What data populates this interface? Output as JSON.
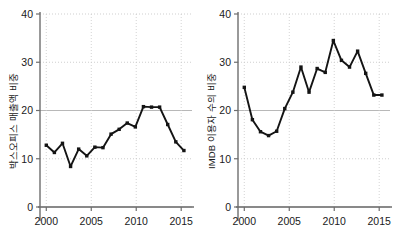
{
  "chart_data": [
    {
      "type": "line",
      "panel": "left",
      "title": "",
      "xlabel": "",
      "ylabel": "박스오피스 매출액 비중",
      "xlim": [
        1999.3,
        2016.2
      ],
      "ylim": [
        0,
        40
      ],
      "yticks": [
        0,
        10,
        20,
        30,
        40
      ],
      "ytick_labels": [
        "0",
        "10",
        "20",
        "30",
        "40"
      ],
      "xticks": [
        2000,
        2005,
        2010,
        2015
      ],
      "xtick_labels": [
        "2000",
        "2005",
        "2010",
        "2015"
      ],
      "grid": true,
      "grid_style": "dotted",
      "marker": "square",
      "color": "#141414",
      "x": [
        2000.0,
        2000.9,
        2001.8,
        2002.7,
        2003.6,
        2004.5,
        2005.4,
        2006.3,
        2007.2,
        2008.1,
        2009.0,
        2009.9,
        2010.8,
        2011.7,
        2012.6,
        2013.5,
        2014.4,
        2015.3
      ],
      "values": [
        12.8,
        11.3,
        13.2,
        8.4,
        12.0,
        10.6,
        12.4,
        12.3,
        15.1,
        16.1,
        17.4,
        16.6,
        20.8,
        20.7,
        20.7,
        17.1,
        13.5,
        11.7
      ]
    },
    {
      "type": "line",
      "panel": "right",
      "title": "",
      "xlabel": "",
      "ylabel": "IMDB 이용자 수의 비중",
      "xlim": [
        1999.3,
        2016.2
      ],
      "ylim": [
        0,
        40
      ],
      "yticks": [
        0,
        10,
        20,
        30,
        40
      ],
      "ytick_labels": [
        "0",
        "10",
        "20",
        "30",
        "40"
      ],
      "xticks": [
        2000,
        2005,
        2010,
        2015
      ],
      "xtick_labels": [
        "2000",
        "2005",
        "2010",
        "2015"
      ],
      "grid": true,
      "grid_style": "dotted",
      "marker": "square",
      "color": "#141414",
      "x": [
        2000.0,
        2000.9,
        2001.8,
        2002.7,
        2003.6,
        2004.5,
        2005.4,
        2006.3,
        2007.2,
        2008.1,
        2009.0,
        2009.9,
        2010.8,
        2011.7,
        2012.6,
        2013.5,
        2014.4,
        2015.3
      ],
      "values": [
        24.8,
        18.1,
        15.6,
        14.8,
        15.7,
        20.4,
        23.8,
        29.0,
        23.8,
        28.7,
        27.9,
        34.5,
        30.4,
        29.0,
        32.3,
        27.7,
        23.2,
        23.2
      ]
    }
  ],
  "left_panel": {
    "ylabel": "박스오피스 매출액 비중"
  },
  "right_panel": {
    "ylabel": "IMDB 이용자 수의 비중"
  }
}
